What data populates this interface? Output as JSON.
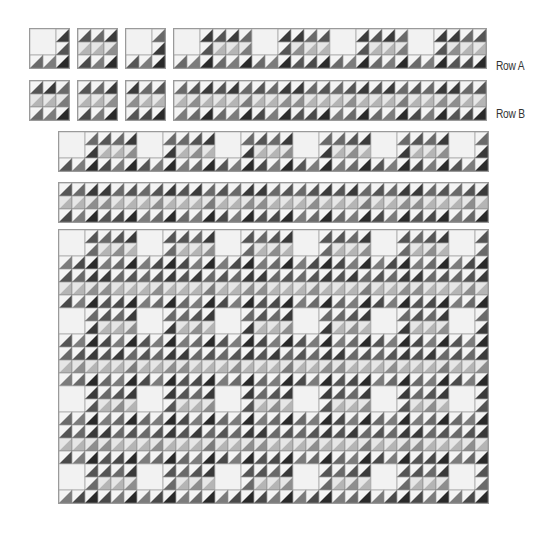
{
  "labels": {
    "row_a": "Row A",
    "row_b": "Row B"
  },
  "colors": {
    "light": "#f4f4f4",
    "white_square": "#f2f2f2",
    "grid_line": "#9a9a9a",
    "shades": [
      "#555555",
      "#6a6a6a",
      "#7c7c7c",
      "#3a3a3a",
      "#b5b5b5",
      "#8e8e8e",
      "#4a4a4a",
      "#2a2a2a"
    ]
  },
  "blocks": {
    "cell_size": 13,
    "block_a": {
      "description": "3x3 block: 2x2 white square in upper-left, half-square triangles on right column and bottom row",
      "white_square": [
        0,
        0,
        2,
        2
      ],
      "shades": [
        [
          -1,
          -1,
          3
        ],
        [
          -1,
          -1,
          0
        ],
        [
          1,
          2,
          7
        ]
      ]
    },
    "block_b": {
      "description": "3x3 block of half-square triangles, light middle row",
      "shades": [
        [
          0,
          3,
          1
        ],
        [
          4,
          4,
          2
        ],
        [
          1,
          2,
          7
        ]
      ]
    }
  },
  "pieces": [
    {
      "name": "single-block-a-1",
      "x": 29,
      "y": 28,
      "cols": 1,
      "rows": 1,
      "pattern": "A"
    },
    {
      "name": "single-block-b-1",
      "x": 77,
      "y": 28,
      "cols": 1,
      "rows": 1,
      "pattern": "B"
    },
    {
      "name": "single-block-a-2",
      "x": 125,
      "y": 28,
      "cols": 1,
      "rows": 1,
      "pattern": "A"
    },
    {
      "name": "row-a-strip",
      "x": 173,
      "y": 28,
      "cols": 8,
      "rows": 1,
      "pattern": "ROW_A"
    },
    {
      "name": "single-block-b-2",
      "x": 29,
      "y": 80,
      "cols": 1,
      "rows": 1,
      "pattern": "B"
    },
    {
      "name": "single-block-b-3",
      "x": 77,
      "y": 80,
      "cols": 1,
      "rows": 1,
      "pattern": "B"
    },
    {
      "name": "single-block-b-4",
      "x": 125,
      "y": 80,
      "cols": 1,
      "rows": 1,
      "pattern": "B"
    },
    {
      "name": "row-b-strip",
      "x": 173,
      "y": 80,
      "cols": 8,
      "rows": 1,
      "pattern": "ROW_B"
    },
    {
      "name": "row-a-full",
      "x": 58,
      "y": 131,
      "cols": 11,
      "rows": 1,
      "pattern": "ROW_A"
    },
    {
      "name": "row-b-full",
      "x": 58,
      "y": 182,
      "cols": 11,
      "rows": 1,
      "pattern": "ROW_B"
    },
    {
      "name": "assembled-quilt",
      "x": 58,
      "y": 229,
      "cols": 11,
      "rows": 7,
      "pattern": "QUILT"
    }
  ],
  "label_positions": {
    "row_a": {
      "x": 496,
      "y": 60
    },
    "row_b": {
      "x": 496,
      "y": 107
    }
  }
}
